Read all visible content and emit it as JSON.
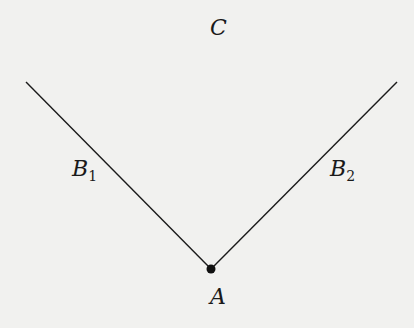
{
  "diagram": {
    "labels": {
      "top": "C",
      "left_arm": "B",
      "left_arm_sub": "1",
      "right_arm": "B",
      "right_arm_sub": "2",
      "vertex": "A"
    },
    "geometry": {
      "vertex": [
        211,
        269
      ],
      "left_end": [
        26,
        82
      ],
      "right_end": [
        397,
        82
      ]
    },
    "colors": {
      "line": "#1a1a1a",
      "background": "#f1f1ef"
    }
  }
}
